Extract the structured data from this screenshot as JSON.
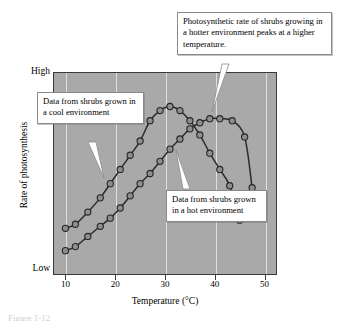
{
  "chart_data": {
    "type": "line",
    "title": "",
    "xlabel": "Temperature (°C)",
    "ylabel": "Rate of photosynthesis",
    "xlim": [
      7.5,
      52.5
    ],
    "ylim": [
      0,
      100
    ],
    "xticks": [
      10,
      20,
      30,
      40,
      50
    ],
    "ytick_labels": [
      "Low",
      "High"
    ],
    "grid": "vertical gridlines at x ticks",
    "legend": "none (inline callout labels)",
    "series": [
      {
        "name": "Data from shrubs grown in a cool environment",
        "x": [
          10,
          12,
          14.5,
          17,
          19,
          21,
          23,
          25,
          27,
          29,
          31,
          33,
          35,
          37,
          39,
          41,
          43,
          45
        ],
        "y": [
          23,
          25,
          31,
          38,
          45,
          52,
          59,
          66,
          76,
          81,
          83,
          81,
          76,
          69,
          60,
          52,
          44,
          27
        ]
      },
      {
        "name": "Data from shrubs grown in a hot environment",
        "x": [
          10,
          12,
          14.5,
          17,
          19,
          21,
          23,
          25,
          27,
          29,
          31,
          33,
          35,
          37,
          39,
          41,
          43.5,
          46,
          47.5
        ],
        "y": [
          12,
          14,
          19,
          24,
          28,
          33,
          39,
          45,
          50,
          56,
          62,
          67,
          72,
          75,
          77,
          77,
          76,
          68,
          43
        ]
      }
    ]
  },
  "axis": {
    "high_label": "High",
    "low_label": "Low",
    "y_title": "Rate of photosynthesis",
    "x_title": "Temperature (°C)",
    "xtick_labels": [
      "10",
      "20",
      "30",
      "40",
      "50"
    ]
  },
  "callouts": {
    "top": "Photosynthetic rate of shrubs growing in a hotter environment peaks at a higher temperature.",
    "cool": "Data from shrubs grown in a cool environment",
    "hot": "Data from shrubs grown in a hot environment"
  },
  "caption_sliver": "Figure 1-12",
  "colors": {
    "plot_background": "#a9a9a9",
    "gridline": "#e8e8e8",
    "curve": "#2b2b2b",
    "marker_fill": "#8e8e8e",
    "marker_stroke": "#262626",
    "callout_background": "#ffffff",
    "callout_border": "#8a8a8a",
    "page_background": "#ffffff"
  }
}
